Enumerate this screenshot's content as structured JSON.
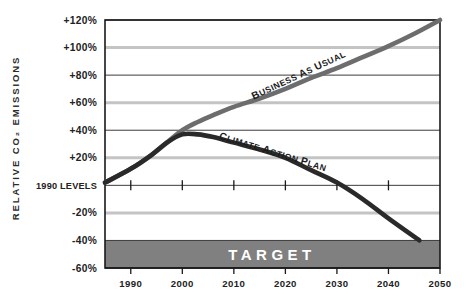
{
  "chart_data": {
    "type": "line",
    "title": "",
    "xlabel": "",
    "ylabel": "RELATIVE CO₂ EMISSIONS",
    "xlim": [
      1985,
      2050
    ],
    "ylim": [
      -60,
      120
    ],
    "grid": true,
    "legend_position": "inline-annotations",
    "x_ticks": [
      "1990",
      "2000",
      "2010",
      "2020",
      "2030",
      "2040",
      "2050"
    ],
    "x_tick_values": [
      1990,
      2000,
      2010,
      2020,
      2030,
      2040,
      2050
    ],
    "y_ticks": [
      "+120%",
      "+100%",
      "+80%",
      "+60%",
      "+40%",
      "+20%",
      "1990 LEVELS",
      "-20%",
      "-40%",
      "-60%"
    ],
    "y_tick_values": [
      120,
      100,
      80,
      60,
      40,
      20,
      0,
      -20,
      -40,
      -60
    ],
    "series": [
      {
        "name": "BUSINESS AS USUAL",
        "color": "#6d6d6d",
        "x": [
          1985,
          1990,
          1994,
          1997,
          2000,
          2003,
          2006,
          2010,
          2015,
          2020,
          2025,
          2030,
          2035,
          2040,
          2045,
          2050
        ],
        "values": [
          2,
          12,
          22,
          31,
          40,
          46,
          51,
          57,
          63,
          70,
          78,
          85,
          93,
          101,
          110,
          120
        ]
      },
      {
        "name": "CLIMATE ACTION PLAN",
        "color": "#2a2a2a",
        "x": [
          1985,
          1990,
          1994,
          1997,
          2000,
          2003,
          2006,
          2010,
          2015,
          2020,
          2025,
          2030,
          2035,
          2040,
          2046
        ],
        "values": [
          2,
          12,
          22,
          31,
          37,
          37,
          35,
          31,
          26,
          20,
          11,
          2,
          -10,
          -24,
          -40
        ]
      }
    ],
    "annotations": [
      {
        "name": "target-band",
        "label": "TARGET",
        "y_from": -60,
        "y_to": -40,
        "color": "#808080"
      }
    ]
  },
  "colors": {
    "axis": "#1a1a1a",
    "grid_major": "#3c3c3c",
    "grid_minor": "#c4c4c4",
    "target_band": "#808080",
    "business_as_usual": "#6d6d6d",
    "climate_action_plan": "#2a2a2a",
    "background": "#ffffff"
  }
}
